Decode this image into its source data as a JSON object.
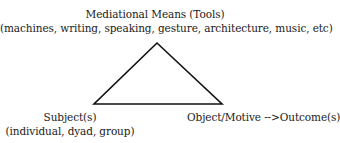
{
  "diagram": {
    "type": "activity-theory-triangle",
    "top_node": {
      "title": "Mediational Means (Tools)",
      "examples": "(machines, writing, speaking, gesture, architecture, music, etc)"
    },
    "left_node": {
      "title": "Subject(s)",
      "examples": "(individual, dyad, group)"
    },
    "right_node": {
      "title": "Object/Motive -->Outcome(s)"
    },
    "triangle": {
      "stroke_color": "#111111",
      "fill_color": "#ffffff"
    }
  }
}
